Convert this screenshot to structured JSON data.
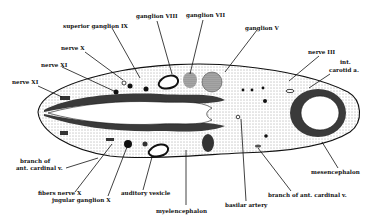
{
  "figure": {
    "type": "anatomical section diagram",
    "colors": {
      "background": "#ffffff",
      "ink": "#111111",
      "stipple_light": "#e6e6e6",
      "stipple_dark": "#5a5a5a",
      "neural_wall": "#3a3a3a"
    }
  },
  "labels": {
    "superior_ganglion_ix": "superior ganglion IX",
    "ganglion_viii": "ganglion VIII",
    "ganglion_vii": "ganglion VII",
    "ganglion_v": "ganglion V",
    "nerve_x": "nerve X",
    "nerve_xi_upper": "nerve XI",
    "nerve_xi_left": "nerve XI",
    "nerve_iii": "nerve III",
    "int_carotid_1": "int.",
    "int_carotid_2": "carotid a.",
    "branch_ant_cardinal_left_1": "branch of",
    "branch_ant_cardinal_left_2": "ant. cardinal v.",
    "fibers_nerve_x": "fibers nerve X",
    "jugular_ganglion_x": "jugular ganglion X",
    "auditory_vesicle": "auditory vesicle",
    "myelencephalon": "myelencephalon",
    "basilar_artery": "basilar artery",
    "branch_ant_cardinal_right": "branch of ant. cardinal v.",
    "mesencephalon": "mesencephalon"
  }
}
